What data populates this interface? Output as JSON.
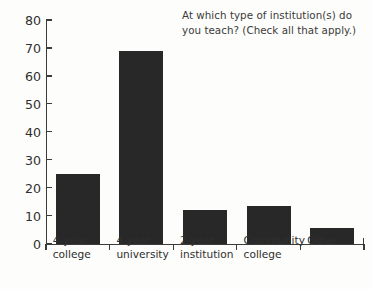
{
  "chart_data": {
    "type": "bar",
    "title": "At which type of institution(s) do you teach? (Check all that apply.)",
    "title_lines": [
      "At which type of institution(s) do",
      "you teach? (Check all that apply.)"
    ],
    "categories": [
      "4-year college",
      "4-year university",
      "2-year institution",
      "Community college",
      "Other"
    ],
    "category_lines": [
      [
        "4-year",
        "college"
      ],
      [
        "4-year",
        "university"
      ],
      [
        "2-year",
        "institution"
      ],
      [
        "Community",
        "college"
      ],
      [
        "Other"
      ]
    ],
    "values": [
      25,
      69,
      12,
      13.5,
      5.5
    ],
    "xlabel": "",
    "ylabel": "",
    "ylim": [
      0,
      80
    ],
    "yticks": [
      0,
      10,
      20,
      30,
      40,
      50,
      60,
      70,
      80
    ],
    "ytick_labels": [
      "0",
      "10",
      "20",
      "30",
      "40",
      "50",
      "60",
      "70",
      "80"
    ],
    "grid": false,
    "legend": false,
    "bar_color": "#282828",
    "axis_color": "#3b3b3b",
    "text_color": "#2f2f2f",
    "background": "#fdfdfb"
  }
}
